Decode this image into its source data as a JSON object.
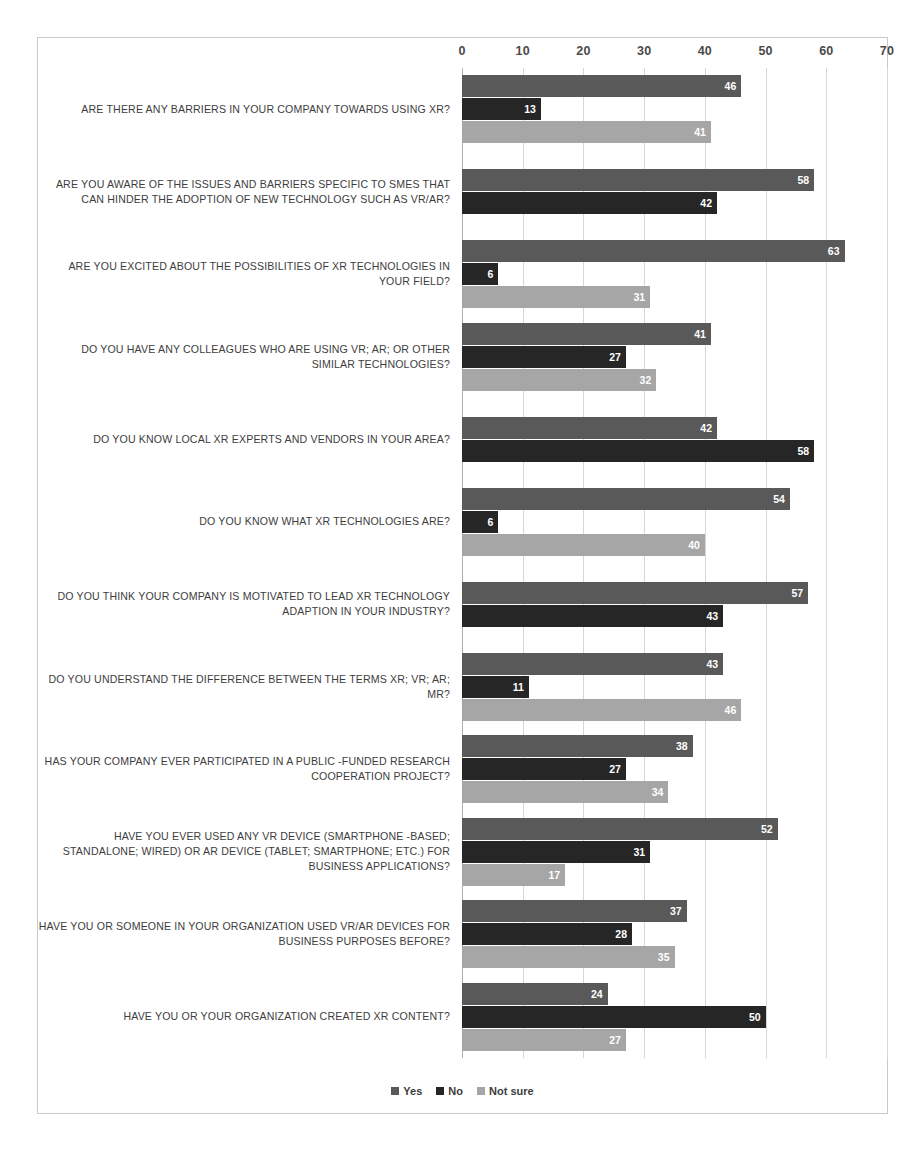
{
  "chart_data": {
    "type": "bar",
    "orientation": "horizontal",
    "title": "",
    "xlabel": "",
    "ylabel": "",
    "xlim": [
      0,
      70
    ],
    "xticks": [
      0,
      10,
      20,
      30,
      40,
      50,
      60,
      70
    ],
    "grid": true,
    "legend_position": "bottom",
    "series": [
      {
        "name": "Yes",
        "color": "#595959"
      },
      {
        "name": "No",
        "color": "#262626"
      },
      {
        "name": "Not sure",
        "color": "#a6a6a6"
      }
    ],
    "categories": [
      "ARE THERE ANY BARRIERS IN YOUR COMPANY TOWARDS USING XR?",
      "ARE YOU AWARE OF THE ISSUES AND BARRIERS SPECIFIC TO SMES THAT CAN HINDER THE ADOPTION OF NEW TECHNOLOGY SUCH AS VR/AR?",
      "ARE YOU EXCITED ABOUT THE POSSIBILITIES OF XR TECHNOLOGIES IN YOUR FIELD?",
      "DO YOU HAVE ANY COLLEAGUES WHO ARE USING VR; AR; OR OTHER SIMILAR TECHNOLOGIES?",
      "DO YOU KNOW LOCAL XR EXPERTS AND VENDORS IN YOUR AREA?",
      "DO YOU KNOW WHAT XR TECHNOLOGIES ARE?",
      "DO YOU THINK YOUR COMPANY IS MOTIVATED TO LEAD XR TECHNOLOGY ADAPTION IN YOUR INDUSTRY?",
      "DO YOU UNDERSTAND THE DIFFERENCE BETWEEN THE TERMS XR; VR; AR; MR?",
      "HAS YOUR COMPANY EVER PARTICIPATED IN A PUBLIC -FUNDED RESEARCH COOPERATION PROJECT?",
      "HAVE YOU EVER USED ANY VR DEVICE (SMARTPHONE -BASED; STANDALONE; WIRED) OR AR DEVICE (TABLET; SMARTPHONE; ETC.) FOR BUSINESS APPLICATIONS?",
      "HAVE YOU OR SOMEONE IN YOUR ORGANIZATION USED VR/AR DEVICES FOR BUSINESS PURPOSES BEFORE?",
      "HAVE YOU OR YOUR ORGANIZATION CREATED XR CONTENT?"
    ],
    "values": {
      "Yes": [
        46,
        58,
        63,
        41,
        42,
        54,
        57,
        43,
        38,
        52,
        37,
        24
      ],
      "No": [
        13,
        42,
        6,
        27,
        58,
        6,
        43,
        11,
        27,
        31,
        28,
        50
      ],
      "Not sure": [
        41,
        null,
        31,
        32,
        null,
        40,
        null,
        46,
        34,
        17,
        35,
        27
      ]
    }
  }
}
